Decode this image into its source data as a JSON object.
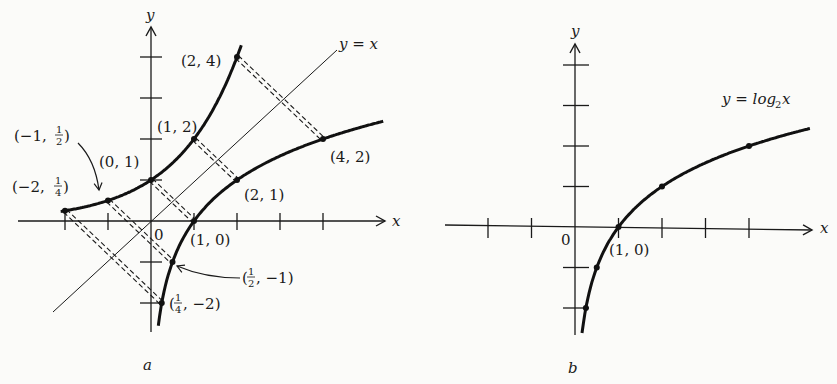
{
  "figure": {
    "panels": [
      {
        "id": "a",
        "caption": "a",
        "axis_labels": {
          "x": "x",
          "y": "y",
          "origin": "0"
        },
        "x_ticks": [
          -2,
          -1,
          1,
          2,
          3,
          4
        ],
        "y_ticks": [
          -2,
          -1,
          1,
          2,
          3,
          4
        ],
        "line_label": "y = x",
        "curves": [
          {
            "name": "exponential",
            "function": "y = 2^x",
            "x_range": [
              -2.1,
              2.1
            ]
          },
          {
            "name": "logarithm",
            "function": "y = log2 x",
            "x_range": [
              0.17,
              5.4
            ]
          }
        ],
        "points": [
          {
            "x": -2,
            "y": 0.25,
            "label": "(−2, 1/4)",
            "label_main": "(−2, ",
            "num": "1",
            "den": "4",
            "tail": ")"
          },
          {
            "x": -1,
            "y": 0.5,
            "label": "(−1, 1/2)",
            "label_main": "(−1, ",
            "num": "1",
            "den": "2",
            "tail": ")"
          },
          {
            "x": 0,
            "y": 1,
            "label": "(0, 1)"
          },
          {
            "x": 1,
            "y": 2,
            "label": "(1, 2)"
          },
          {
            "x": 2,
            "y": 4,
            "label": "(2, 4)"
          },
          {
            "x": 0.25,
            "y": -2,
            "label": "(1/4, −2)",
            "label_main": "(",
            "num": "1",
            "den": "4",
            "tail": ", −2)"
          },
          {
            "x": 0.5,
            "y": -1,
            "label": "(1/2, −1)",
            "label_main": "(",
            "num": "1",
            "den": "2",
            "tail": ", −1)"
          },
          {
            "x": 1,
            "y": 0,
            "label": "(1, 0)"
          },
          {
            "x": 2,
            "y": 1,
            "label": "(2, 1)"
          },
          {
            "x": 4,
            "y": 2,
            "label": "(4, 2)"
          }
        ],
        "reflection_pairs": [
          [
            [
              -2,
              0.25
            ],
            [
              0.25,
              -2
            ]
          ],
          [
            [
              -1,
              0.5
            ],
            [
              0.5,
              -1
            ]
          ],
          [
            [
              0,
              1
            ],
            [
              1,
              0
            ]
          ],
          [
            [
              1,
              2
            ],
            [
              2,
              1
            ]
          ],
          [
            [
              2,
              4
            ],
            [
              4,
              2
            ]
          ]
        ]
      },
      {
        "id": "b",
        "caption": "b",
        "axis_labels": {
          "x": "x",
          "y": "y",
          "origin": "0"
        },
        "x_ticks": [
          -2,
          -1,
          1,
          2,
          3,
          4
        ],
        "y_ticks": [
          -2,
          -1,
          1,
          2,
          3,
          4
        ],
        "curve_label": {
          "main": "y = log",
          "sub": "2",
          "tail": " x"
        },
        "curves": [
          {
            "name": "logarithm",
            "function": "y = log2 x",
            "x_range": [
              0.16,
              5.4
            ]
          }
        ],
        "points": [
          {
            "x": 0.25,
            "y": -2
          },
          {
            "x": 0.5,
            "y": -1
          },
          {
            "x": 1,
            "y": 0,
            "label": "(1, 0)"
          },
          {
            "x": 2,
            "y": 1
          },
          {
            "x": 4,
            "y": 2
          }
        ]
      }
    ]
  }
}
